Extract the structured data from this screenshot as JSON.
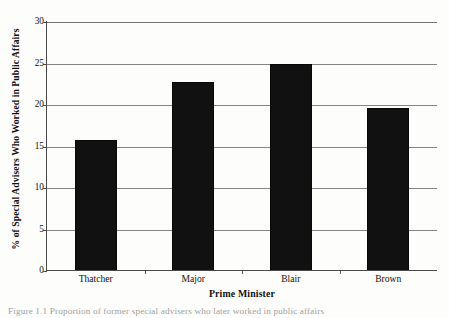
{
  "chart_data": {
    "type": "bar",
    "title": "",
    "subtitle": "",
    "categories": [
      "Thatcher",
      "Major",
      "Blair",
      "Brown"
    ],
    "values": [
      15.8,
      22.8,
      25.0,
      19.6
    ],
    "series": [
      {
        "name": "% of Special Advisers Who Worked in Public Affairs",
        "values": [
          15.8,
          22.8,
          25.0,
          19.6
        ]
      }
    ],
    "xlabel": "Prime Minister",
    "ylabel": "% of Special Advisers Who Worked in Public Affairs",
    "ylim": [
      0,
      30
    ],
    "yticks": [
      0,
      5,
      10,
      15,
      20,
      25,
      30
    ],
    "ytick_labels": [
      "0",
      "5",
      "10",
      "15",
      "20",
      "25",
      "30"
    ],
    "grid": "horizontal",
    "legend": "none",
    "bar_color": "#111111",
    "gridline_color": "#6f6f6f",
    "axis_color": "#4a4a4a",
    "background": "#fdfdfc"
  },
  "axes": {
    "y_title": "% of Special Advisers Who Worked in Public Affairs",
    "x_title": "Prime Minister"
  },
  "caption": {
    "text": "Figure 1.1 Proportion of former special advisers who later worked in public affairs"
  }
}
